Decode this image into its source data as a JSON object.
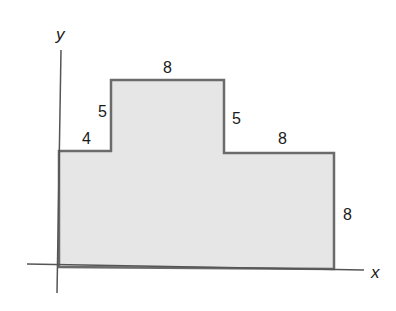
{
  "figure": {
    "colors": {
      "fill": "#e6e6e6",
      "outline": "#6b6b6b",
      "axis": "#555555",
      "text": "#1a1a1a"
    },
    "axes": {
      "x_label": "x",
      "y_label": "y"
    },
    "side_labels": {
      "left_step_width": "4",
      "left_step_rise": "5",
      "top_width": "8",
      "right_step_drop": "5",
      "right_shelf_width": "8",
      "right_height": "8"
    }
  }
}
